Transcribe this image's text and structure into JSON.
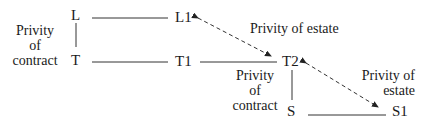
{
  "diagram": {
    "nodes": {
      "L": "L",
      "L1": "L1",
      "T": "T",
      "T1": "T1",
      "T2": "T2",
      "S": "S",
      "S1": "S1"
    },
    "labels": {
      "left_contract": [
        "Privity",
        "of",
        "contract"
      ],
      "top_estate": "Privity of estate",
      "middle_contract": [
        "Privity",
        "of",
        "contract"
      ],
      "right_estate": [
        "Privity of",
        "estate"
      ]
    },
    "edges": [
      {
        "from": "L",
        "to": "T",
        "style": "solid"
      },
      {
        "from": "L",
        "to": "L1",
        "style": "solid"
      },
      {
        "from": "T",
        "to": "T1",
        "style": "solid"
      },
      {
        "from": "T1",
        "to": "T2",
        "style": "solid"
      },
      {
        "from": "T2",
        "to": "S",
        "style": "solid"
      },
      {
        "from": "S",
        "to": "S1",
        "style": "solid"
      },
      {
        "from": "L1",
        "to": "T2",
        "style": "dashed-double-arrow"
      },
      {
        "from": "T2",
        "to": "S1",
        "style": "dashed-double-arrow"
      }
    ],
    "colors": {
      "line": "#333333",
      "text": "#1a1a1a"
    }
  }
}
